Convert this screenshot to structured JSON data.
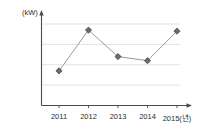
{
  "chart_data": {
    "type": "line",
    "title": "",
    "unit_label": "(kW)",
    "xlabel": "",
    "ylabel": "",
    "categories": [
      "2011",
      "2012",
      "2013",
      "2014",
      "2015(년)"
    ],
    "x_values": [
      2011,
      2012,
      2013,
      2014,
      2015
    ],
    "values": [
      17000,
      37000,
      24000,
      22000,
      36500
    ],
    "series": [
      {
        "name": "",
        "values": [
          17000,
          37000,
          24000,
          22000,
          36500
        ]
      }
    ],
    "ylim": [
      0,
      42000
    ],
    "y_ticks": [
      0,
      10000,
      20000,
      30000,
      40000
    ],
    "y_tick_labels": [
      "0",
      "10,000",
      "20,000",
      "30,000",
      "40,000"
    ],
    "grid": true,
    "grid_axis": "y",
    "legend": false,
    "marker": "diamond",
    "line_color": "#9a9a9a",
    "marker_color": "#6b6b6b",
    "grid_color": "#e2e2e2",
    "axis_color": "#4a4a4a",
    "background_color": "#ffffff"
  }
}
